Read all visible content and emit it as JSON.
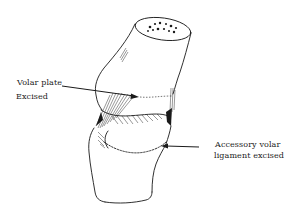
{
  "figure": {
    "ink_color": "#1a1a1a",
    "background_color": "#ffffff"
  },
  "labels": {
    "volar_plate": {
      "line1": "Volar plate",
      "line2": "Excised"
    },
    "accessory_ligament": {
      "line1": "Accessory volar",
      "line2": "ligament excised"
    }
  }
}
